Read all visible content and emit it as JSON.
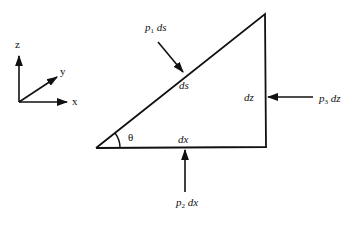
{
  "figure": {
    "axes": {
      "x": "x",
      "y": "y",
      "z": "z"
    },
    "triangle": {
      "hypotenuse_label": "ds",
      "vertical_label": "dz",
      "horizontal_label": "dx",
      "angle_label": "θ"
    },
    "forces": {
      "p1": {
        "symbol": "p",
        "sub": "1",
        "suffix": " ds"
      },
      "p2": {
        "symbol": "p",
        "sub": "2",
        "suffix": " dx"
      },
      "p3": {
        "symbol": "p",
        "sub": "3",
        "suffix": " dz"
      }
    },
    "colors": {
      "line": "#111111",
      "background": "#ffffff"
    }
  }
}
